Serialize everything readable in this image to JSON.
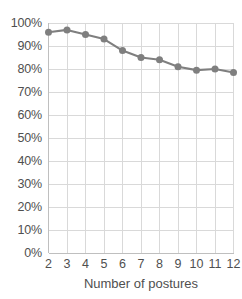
{
  "chart_data": {
    "type": "line",
    "title": "",
    "subtitle": "",
    "xlabel": "Number of postures",
    "ylabel": "",
    "categories": [
      2,
      3,
      4,
      5,
      6,
      7,
      8,
      9,
      10,
      11,
      12
    ],
    "x": [
      2,
      3,
      4,
      5,
      6,
      7,
      8,
      9,
      10,
      11,
      12
    ],
    "values": [
      96,
      97,
      95,
      93,
      88,
      85,
      84,
      81,
      79.5,
      80,
      78.5
    ],
    "series": [
      {
        "name": "accuracy",
        "values": [
          96,
          97,
          95,
          93,
          88,
          85,
          84,
          81,
          79.5,
          80,
          78.5
        ]
      }
    ],
    "xlim": [
      2,
      12
    ],
    "ylim": [
      0,
      100
    ],
    "ytick_values": [
      0,
      10,
      20,
      30,
      40,
      50,
      60,
      70,
      80,
      90,
      100
    ],
    "ytick_labels": [
      "0%",
      "10%",
      "20%",
      "30%",
      "40%",
      "50%",
      "60%",
      "70%",
      "80%",
      "90%",
      "100%"
    ],
    "xtick_labels": [
      "2",
      "3",
      "4",
      "5",
      "6",
      "7",
      "8",
      "9",
      "10",
      "11",
      "12"
    ],
    "grid": true,
    "grid_axis": "both",
    "legend": false,
    "legend_position": "none",
    "marker": "circle",
    "line_color": "#7f7f7f",
    "marker_color": "#7f7f7f",
    "grid_color": "#d9d9d9",
    "axis_color": "#bfbfbf",
    "text_color": "#4f4f4f",
    "background": "#ffffff"
  },
  "axes": {
    "x_title": "Number of postures"
  }
}
